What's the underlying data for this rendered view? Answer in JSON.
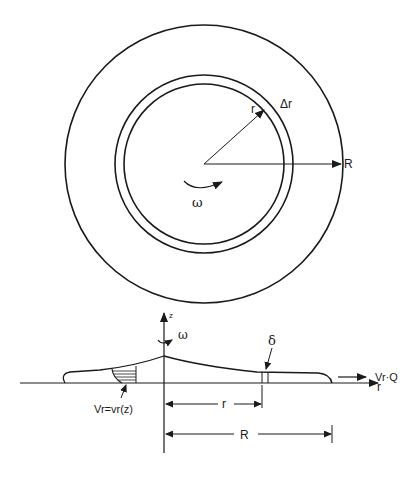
{
  "diagram": {
    "type": "rotating-disk-film-flow",
    "colors": {
      "ink": "#1a1a1a",
      "background": "#ffffff"
    },
    "top_view": {
      "labels": {
        "inner_radius": "r",
        "ring_width": "Δr",
        "outer_radius": "R",
        "angular_velocity": "ω"
      }
    },
    "side_view": {
      "labels": {
        "z_axis": "z",
        "angular_velocity": "ω",
        "film_thickness": "δ",
        "r_axis": "r",
        "exit_flow": "Vr·Q",
        "velocity_profile": "Vr=vr(z)",
        "dim_r": "r",
        "dim_R": "R"
      }
    }
  }
}
